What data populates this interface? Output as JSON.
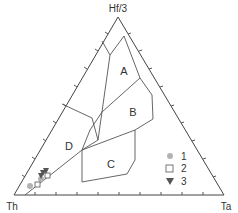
{
  "diagram": {
    "type": "ternary",
    "vertices": {
      "top": "Hf/3",
      "left": "Th",
      "right": "Ta"
    },
    "fields": [
      {
        "id": "A",
        "label": "A"
      },
      {
        "id": "B",
        "label": "B"
      },
      {
        "id": "C",
        "label": "C"
      },
      {
        "id": "D",
        "label": "D"
      }
    ],
    "legend": [
      {
        "symbol": "circle",
        "label": "1",
        "color": "#b3b3b3"
      },
      {
        "symbol": "square",
        "label": "2",
        "color": "#ffffff"
      },
      {
        "symbol": "triangle-down",
        "label": "3",
        "color": "#555555"
      }
    ]
  }
}
